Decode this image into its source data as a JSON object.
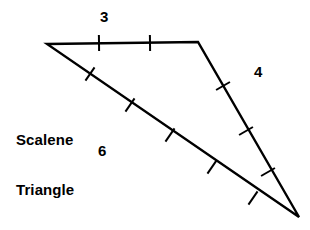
{
  "figure": {
    "name": "scalene-triangle-diagram",
    "shape_name_line1": "Scalene",
    "shape_name_line2": "Triangle",
    "stroke_color": "#000000",
    "background_color": "#ffffff",
    "text_color": "#000000",
    "stroke_width": 2.4,
    "tick_stroke_width": 2.0,
    "vertices": {
      "left": {
        "label": "A",
        "x": 47,
        "y": 44
      },
      "top_right": {
        "label": "B",
        "x": 198,
        "y": 42
      },
      "bottom_right": {
        "label": "C",
        "x": 299,
        "y": 217
      }
    },
    "sides": [
      {
        "id": "top",
        "label": "3",
        "length_units": 3,
        "from": "left",
        "to": "top_right",
        "tick_count": 2,
        "ticks": [
          {
            "x": 99,
            "y": 43
          },
          {
            "x": 150,
            "y": 43
          }
        ],
        "tick_angle_deg": 90,
        "label_position": {
          "x": 105,
          "y": 18
        }
      },
      {
        "id": "right",
        "label": "4",
        "length_units": 4,
        "from": "top_right",
        "to": "bottom_right",
        "tick_count": 3,
        "ticks": [
          {
            "x": 223,
            "y": 86
          },
          {
            "x": 246,
            "y": 131
          },
          {
            "x": 268,
            "y": 172
          }
        ],
        "tick_angle_deg": 60,
        "label_position": {
          "x": 259,
          "y": 73
        }
      },
      {
        "id": "bottom",
        "label": "6",
        "length_units": 6,
        "from": "left",
        "to": "bottom_right",
        "tick_count": 5,
        "ticks": [
          {
            "x": 90,
            "y": 74
          },
          {
            "x": 130,
            "y": 105
          },
          {
            "x": 170,
            "y": 135
          },
          {
            "x": 212,
            "y": 167
          },
          {
            "x": 253,
            "y": 198
          }
        ],
        "tick_angle_deg": 35,
        "label_position": {
          "x": 103,
          "y": 152
        }
      }
    ]
  }
}
